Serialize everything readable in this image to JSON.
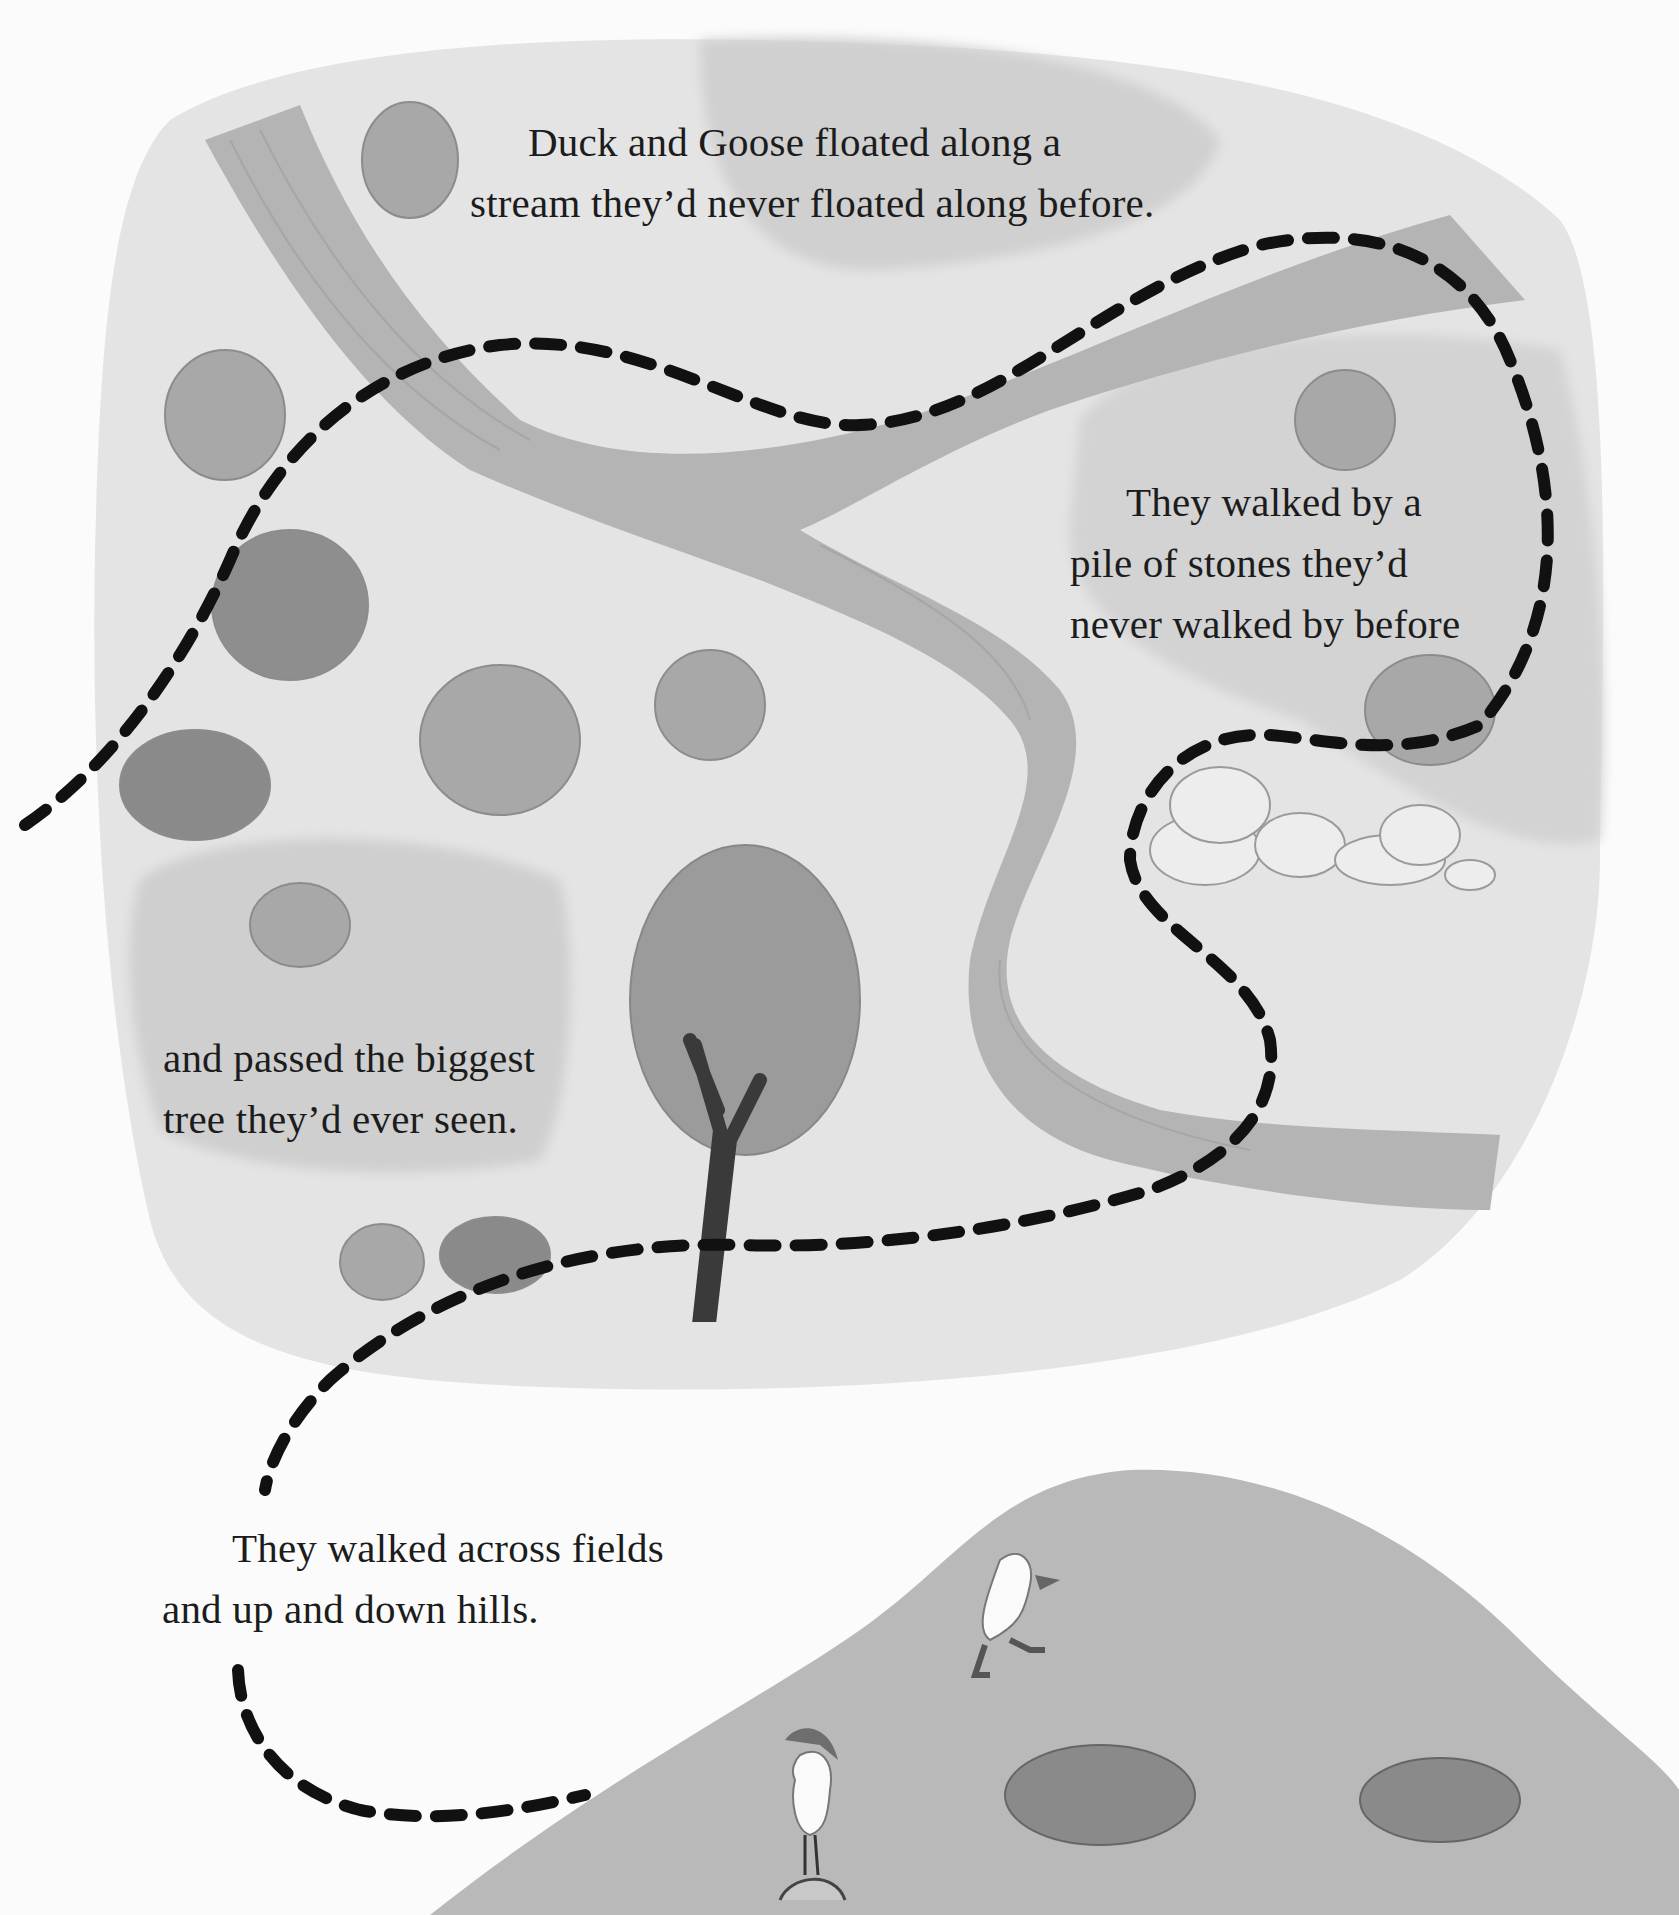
{
  "page": {
    "style": "grayscale picture-book illustration of a route map",
    "colors": {
      "paper": "#fbfbfb",
      "land": "#e4e4e4",
      "meadow_dark": "#d2d2d2",
      "stream": "#b4b4b4",
      "tree": "#9a9a9a",
      "hill": "#b9b9b9",
      "path": "#111111",
      "text": "#1c1c1c"
    }
  },
  "captions": {
    "stream": {
      "lines": [
        "Duck and Goose floated along a",
        "stream they’d never floated along before."
      ]
    },
    "stones": {
      "lines": [
        "They walked by a",
        "pile of stones they’d",
        "never walked by before"
      ]
    },
    "tree": {
      "lines": [
        "and passed the biggest",
        "tree they’d ever seen."
      ]
    },
    "hills": {
      "lines": [
        "They walked across fields",
        "and up and down hills."
      ]
    }
  },
  "map_features": {
    "stream": "winding stream crossing the map",
    "stone_pile": "pile of stones",
    "big_tree": "biggest tree",
    "bushes_count": 11,
    "hill": "large hill at bottom right",
    "characters": [
      "Duck",
      "Goose"
    ],
    "path": "dashed walking route"
  }
}
